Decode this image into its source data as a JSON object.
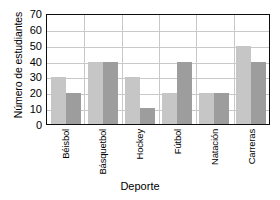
{
  "chart_data": {
    "type": "bar",
    "title": "",
    "xlabel": "Deporte",
    "ylabel": "Número de estudiantes",
    "categories": [
      "Béisbol",
      "Básquetbol",
      "Hockey",
      "Fútbol",
      "Natación",
      "Carreras"
    ],
    "series": [
      {
        "name": "serie-1",
        "color": "#c6c6c6",
        "values": [
          30,
          40,
          30,
          20,
          20,
          50
        ]
      },
      {
        "name": "serie-2",
        "color": "#9d9d9d",
        "values": [
          20,
          40,
          10,
          40,
          20,
          40
        ]
      }
    ],
    "ylim": [
      0,
      70
    ],
    "ytick_values": [
      0,
      10,
      20,
      30,
      40,
      50,
      60,
      70
    ],
    "ytick_labels": [
      "0",
      "10",
      "20",
      "30",
      "40",
      "50",
      "60",
      "70"
    ],
    "grid": true,
    "legend": "none",
    "axis_color": "#0d0d0d",
    "grid_color": "#c9c9c9"
  }
}
